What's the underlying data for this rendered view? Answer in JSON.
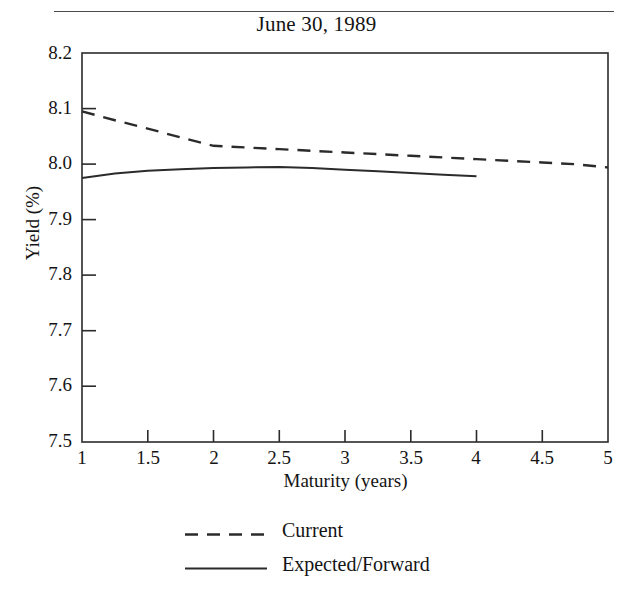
{
  "figure": {
    "title": "June 30, 1989",
    "has_top_rule": true,
    "partial_text_above_rule": ","
  },
  "chart_data": {
    "type": "line",
    "title": "June 30, 1989",
    "xlabel": "Maturity (years)",
    "ylabel": "Yield (%)",
    "xlim": [
      1,
      5
    ],
    "ylim": [
      7.5,
      8.2
    ],
    "grid": false,
    "legend_position": "below-axes",
    "xticks": [
      1,
      1.5,
      2,
      2.5,
      3,
      3.5,
      4,
      4.5,
      5
    ],
    "xtick_labels": [
      "1",
      "1.5",
      "2",
      "2.5",
      "3",
      "3.5",
      "4",
      "4.5",
      "5"
    ],
    "yticks": [
      7.5,
      7.6,
      7.7,
      7.8,
      7.9,
      8.0,
      8.1,
      8.2
    ],
    "ytick_labels": [
      "7.5",
      "7.6",
      "7.7",
      "7.8",
      "7.9",
      "8.0",
      "8.1",
      "8.2"
    ],
    "series": [
      {
        "name": "Current",
        "style": "dashed",
        "color": "#2b2b2b",
        "x": [
          1.0,
          1.25,
          1.5,
          1.75,
          2.0,
          2.25,
          2.5,
          2.75,
          3.0,
          3.25,
          3.5,
          3.75,
          4.0,
          4.25,
          4.5,
          4.75,
          5.0
        ],
        "y": [
          8.095,
          8.079,
          8.064,
          8.048,
          8.033,
          8.03,
          8.027,
          8.024,
          8.021,
          8.018,
          8.015,
          8.012,
          8.009,
          8.006,
          8.003,
          8.0,
          7.994
        ]
      },
      {
        "name": "Expected/Forward",
        "style": "solid",
        "color": "#2b2b2b",
        "x": [
          1.0,
          1.25,
          1.5,
          1.75,
          2.0,
          2.25,
          2.5,
          2.75,
          3.0,
          3.25,
          3.5,
          3.75,
          4.0
        ],
        "y": [
          7.975,
          7.983,
          7.988,
          7.991,
          7.993,
          7.994,
          7.995,
          7.993,
          7.99,
          7.987,
          7.984,
          7.981,
          7.978
        ]
      }
    ]
  },
  "legend": {
    "entries": [
      {
        "label": "Current",
        "style": "dashed"
      },
      {
        "label": "Expected/Forward",
        "style": "solid"
      }
    ]
  }
}
